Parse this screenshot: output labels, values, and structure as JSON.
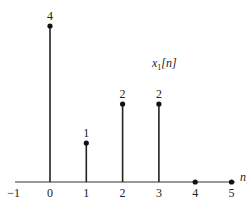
{
  "chart_data": {
    "type": "stem",
    "title": "x1[n]",
    "title_main": "x",
    "title_sub": "1",
    "title_arg": "[n]",
    "xlabel": "n",
    "ylabel": "",
    "x_ticks": [
      "-1",
      "0",
      "1",
      "2",
      "3",
      "4",
      "5"
    ],
    "x": [
      0,
      1,
      2,
      3,
      4,
      5
    ],
    "values": [
      4,
      1,
      2,
      2,
      0,
      0
    ],
    "value_labels": [
      "4",
      "1",
      "2",
      "2",
      "",
      ""
    ],
    "xlim": [
      -1,
      5
    ],
    "ylim": [
      0,
      4
    ],
    "grid": false,
    "legend": "none"
  }
}
